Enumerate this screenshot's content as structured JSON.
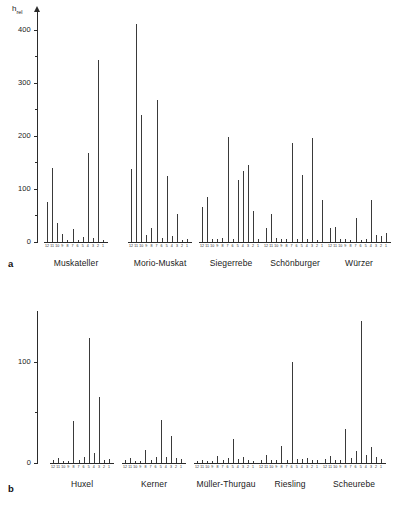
{
  "figure": {
    "panels": [
      "a",
      "b"
    ],
    "axis_title": "h",
    "axis_title_sub": "rel",
    "label_a": "a",
    "label_b": "b"
  },
  "chart_data": {
    "type": "bar",
    "title": "",
    "xlabel": "",
    "ylabel": "h_rel",
    "categories": [
      "12",
      "11",
      "10",
      "9",
      "8",
      "7",
      "6",
      "5",
      "4",
      "3",
      "2",
      "1"
    ],
    "panels": [
      {
        "id": "a",
        "ylim": [
          0,
          430
        ],
        "yticks": [
          0,
          100,
          200,
          300,
          400
        ],
        "ytick_labels": [
          "0",
          "100",
          "200",
          "300",
          "400"
        ],
        "minor_tick_step": 50,
        "grid": false,
        "series": [
          {
            "name": "Muskateller",
            "values": [
              76,
              140,
              35,
              16,
              3,
              25,
              3,
              9,
              168,
              8,
              343,
              4
            ]
          },
          {
            "name": "Morio-Muskat",
            "values": [
              137,
              412,
              239,
              14,
              27,
              267,
              7,
              124,
              12,
              53,
              4,
              6
            ]
          },
          {
            "name": "Siegerrebe",
            "values": [
              66,
              84,
              5,
              6,
              7,
              198,
              5,
              117,
              134,
              146,
              58,
              5
            ]
          },
          {
            "name": "Schönburger",
            "values": [
              27,
              53,
              7,
              5,
              6,
              187,
              5,
              127,
              5,
              196,
              4,
              79
            ]
          },
          {
            "name": "Würzer",
            "values": [
              27,
              29,
              6,
              5,
              4,
              46,
              4,
              5,
              80,
              14,
              11,
              17
            ]
          }
        ]
      },
      {
        "id": "b",
        "ylim": [
          0,
          150
        ],
        "yticks": [
          0,
          100
        ],
        "ytick_labels": [
          "0",
          "100"
        ],
        "minor_tick_step": 50,
        "grid": false,
        "series": [
          {
            "name": "Huxel",
            "values": [
              3,
              5,
              2,
              2,
              41,
              3,
              6,
              123,
              10,
              65,
              3,
              4
            ]
          },
          {
            "name": "Kerner",
            "values": [
              3,
              5,
              2,
              2,
              13,
              3,
              6,
              42,
              6,
              27,
              5,
              4
            ]
          },
          {
            "name": "Müller-Thurgau",
            "values": [
              2,
              3,
              2,
              2,
              7,
              3,
              5,
              24,
              4,
              6,
              3,
              2
            ]
          },
          {
            "name": "Riesling",
            "values": [
              3,
              8,
              3,
              3,
              17,
              3,
              100,
              4,
              4,
              5,
              3,
              3
            ]
          },
          {
            "name": "Scheurebe",
            "values": [
              4,
              7,
              3,
              3,
              34,
              5,
              12,
              140,
              8,
              16,
              6,
              4
            ]
          }
        ]
      }
    ]
  },
  "panel_a": {
    "ytick_labels": [
      "400",
      "300",
      "200",
      "100",
      "0"
    ],
    "groups": [
      {
        "name": "Muskateller"
      },
      {
        "name": "Morio-Muskat"
      },
      {
        "name": "Siegerrebe"
      },
      {
        "name": "Schönburger"
      },
      {
        "name": "Würzer"
      }
    ]
  },
  "panel_b": {
    "ytick_labels": [
      "100",
      "0"
    ],
    "groups": [
      {
        "name": "Huxel"
      },
      {
        "name": "Kerner"
      },
      {
        "name": "Müller-Thurgau"
      },
      {
        "name": "Riesling"
      },
      {
        "name": "Scheurebe"
      }
    ]
  }
}
